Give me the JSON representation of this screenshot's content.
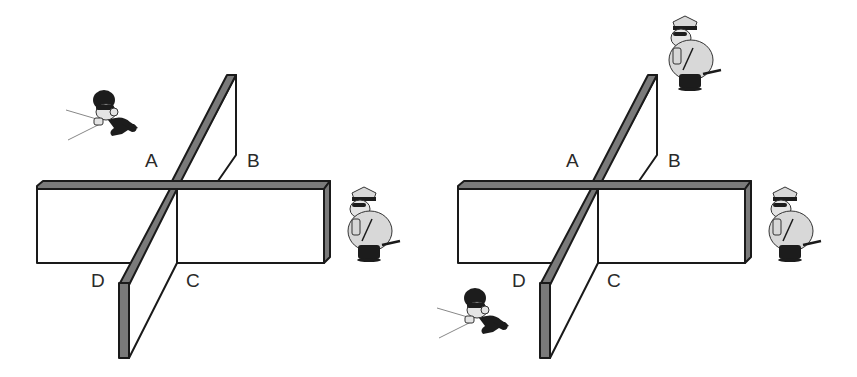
{
  "figure": {
    "panels": [
      {
        "id": "left",
        "corner_labels": {
          "A": "A",
          "B": "B",
          "C": "C",
          "D": "D"
        },
        "characters": [
          {
            "type": "thief",
            "position": "upper-left, region A side",
            "facing": "left",
            "holding": "flashlight"
          },
          {
            "type": "police-officer",
            "position": "right of wall, beside region B/C"
          }
        ]
      },
      {
        "id": "right",
        "corner_labels": {
          "A": "A",
          "B": "B",
          "C": "C",
          "D": "D"
        },
        "characters": [
          {
            "type": "police-officer",
            "position": "top, above region B"
          },
          {
            "type": "police-officer",
            "position": "right of wall, beside region B/C"
          },
          {
            "type": "thief",
            "position": "lower-left, region D side",
            "facing": "left",
            "holding": "flashlight"
          }
        ]
      }
    ],
    "colors": {
      "wall_edge": "#7a7a7a",
      "outline": "#1a1a1a",
      "background": "#ffffff"
    }
  }
}
